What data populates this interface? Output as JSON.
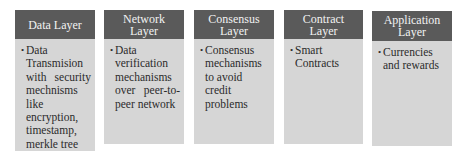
{
  "diagram": {
    "layers": [
      {
        "title_lines": [
          "Data Layer"
        ],
        "items": [
          "Data Transmision with security mechnisms like encryption, timestamp, merkle tree"
        ]
      },
      {
        "title_lines": [
          "Network",
          "Layer"
        ],
        "items": [
          "Data verification mechanisms over peer-to-peer network"
        ]
      },
      {
        "title_lines": [
          "Consensus",
          "Layer"
        ],
        "items": [
          "Consensus mechanisms to avoid credit problems"
        ]
      },
      {
        "title_lines": [
          "Contract",
          "Layer"
        ],
        "items": [
          "Smart Contracts"
        ]
      },
      {
        "title_lines": [
          "Application",
          "Layer"
        ],
        "items": [
          "Currencies and rewards"
        ]
      }
    ],
    "bullet_glyph": "•",
    "colors": {
      "header_bg": "#5a5a5a",
      "header_text": "#f2f2f2",
      "body_bg": "#d6d6d6",
      "body_text": "#2b2b2b"
    }
  }
}
